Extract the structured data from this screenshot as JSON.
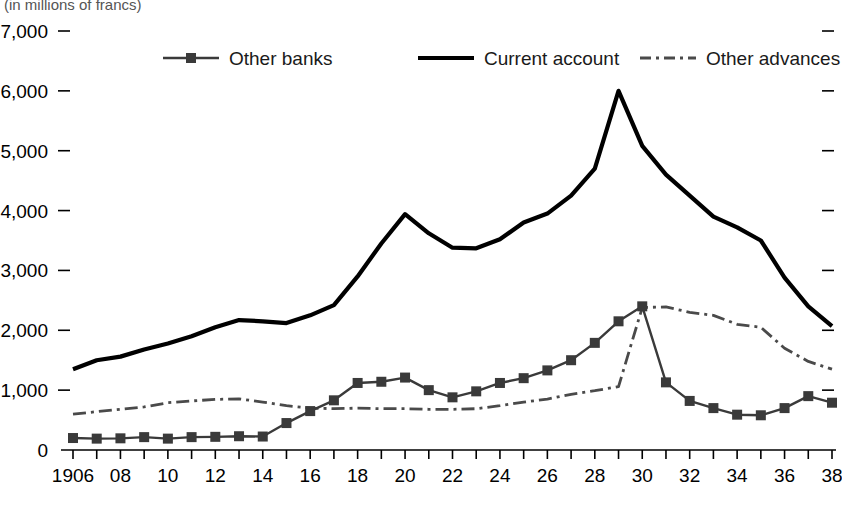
{
  "figure": {
    "unit_note": "(in millions of francs)",
    "background": "#ffffff",
    "ink_color": "#000000"
  },
  "legend": {
    "position": "top-inside",
    "entries": [
      {
        "label": "Other banks",
        "style": "line-square-marker",
        "color": "#3a3a3a",
        "marker": "square"
      },
      {
        "label": "Current account",
        "style": "solid-thick",
        "color": "#000000",
        "marker": "none"
      },
      {
        "label": "Other advances",
        "style": "dash-dot",
        "color": "#4a4a4a",
        "marker": "none"
      }
    ]
  },
  "axes": {
    "y_ticks": [
      "0",
      "1,000",
      "2,000",
      "3,000",
      "4,000",
      "5,000",
      "6,000",
      "7,000"
    ],
    "y_tick_values": [
      0,
      1000,
      2000,
      3000,
      4000,
      5000,
      6000,
      7000
    ],
    "x_tick_labels": [
      "1906",
      "08",
      "10",
      "12",
      "14",
      "16",
      "18",
      "20",
      "22",
      "24",
      "26",
      "28",
      "30",
      "32",
      "34",
      "36",
      "38"
    ],
    "x_tick_years": [
      1906,
      1908,
      1910,
      1912,
      1914,
      1916,
      1918,
      1920,
      1922,
      1924,
      1926,
      1928,
      1930,
      1932,
      1934,
      1936,
      1938
    ],
    "right_ticks_shown": true
  },
  "chart_data": {
    "type": "line",
    "title": "",
    "subtitle": "",
    "xlabel": "",
    "ylabel": "",
    "unit_note": "(in millions of francs)",
    "xlim": [
      1906,
      1938
    ],
    "ylim": [
      0,
      7000
    ],
    "grid": false,
    "legend_position": "top-inside",
    "x": [
      1906,
      1907,
      1908,
      1909,
      1910,
      1911,
      1912,
      1913,
      1914,
      1915,
      1916,
      1917,
      1918,
      1919,
      1920,
      1921,
      1922,
      1923,
      1924,
      1925,
      1926,
      1927,
      1928,
      1929,
      1930,
      1931,
      1932,
      1933,
      1934,
      1935,
      1936,
      1937,
      1938
    ],
    "series": [
      {
        "name": "Current account",
        "style": "solid-thick",
        "color": "#000000",
        "values": [
          1350,
          1500,
          1560,
          1680,
          1780,
          1900,
          2050,
          2170,
          2150,
          2120,
          2250,
          2420,
          2900,
          3450,
          3940,
          3620,
          3380,
          3370,
          3520,
          3800,
          3950,
          4250,
          4700,
          6000,
          5080,
          4600,
          4250,
          3900,
          3720,
          3500,
          2880,
          2400,
          2070
        ]
      },
      {
        "name": "Other banks",
        "style": "line-square-marker",
        "color": "#3a3a3a",
        "marker": "square",
        "values": [
          200,
          190,
          195,
          215,
          190,
          215,
          220,
          230,
          225,
          450,
          650,
          830,
          1120,
          1140,
          1210,
          1000,
          880,
          980,
          1120,
          1200,
          1330,
          1500,
          1790,
          2150,
          2400,
          1130,
          820,
          700,
          590,
          580,
          700,
          900,
          790
        ]
      },
      {
        "name": "Other advances",
        "style": "dash-dot",
        "color": "#4a4a4a",
        "values": [
          600,
          640,
          680,
          720,
          790,
          820,
          845,
          855,
          800,
          740,
          700,
          690,
          700,
          690,
          690,
          680,
          680,
          690,
          740,
          800,
          850,
          930,
          990,
          1060,
          2380,
          2390,
          2300,
          2250,
          2100,
          2050,
          1700,
          1480,
          1350
        ]
      }
    ]
  }
}
